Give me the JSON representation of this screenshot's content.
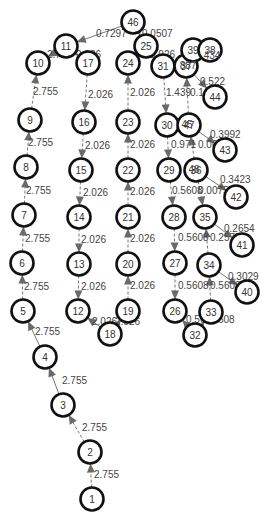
{
  "graph": {
    "type": "directed-weighted-graph",
    "nodes": [
      {
        "id": "1",
        "x": 92,
        "y": 499
      },
      {
        "id": "2",
        "x": 90,
        "y": 452
      },
      {
        "id": "3",
        "x": 63,
        "y": 405
      },
      {
        "id": "4",
        "x": 45,
        "y": 357
      },
      {
        "id": "5",
        "x": 23,
        "y": 311
      },
      {
        "id": "6",
        "x": 22,
        "y": 263
      },
      {
        "id": "7",
        "x": 24,
        "y": 215
      },
      {
        "id": "8",
        "x": 26,
        "y": 167
      },
      {
        "id": "9",
        "x": 30,
        "y": 120
      },
      {
        "id": "10",
        "x": 38,
        "y": 63
      },
      {
        "id": "11",
        "x": 66,
        "y": 46
      },
      {
        "id": "17",
        "x": 88,
        "y": 63
      },
      {
        "id": "16",
        "x": 84,
        "y": 122
      },
      {
        "id": "15",
        "x": 81,
        "y": 170
      },
      {
        "id": "14",
        "x": 79,
        "y": 217
      },
      {
        "id": "13",
        "x": 79,
        "y": 264
      },
      {
        "id": "12",
        "x": 78,
        "y": 311
      },
      {
        "id": "18",
        "x": 110,
        "y": 334
      },
      {
        "id": "19",
        "x": 128,
        "y": 311
      },
      {
        "id": "20",
        "x": 128,
        "y": 264
      },
      {
        "id": "21",
        "x": 128,
        "y": 217
      },
      {
        "id": "22",
        "x": 128,
        "y": 170
      },
      {
        "id": "23",
        "x": 128,
        "y": 122
      },
      {
        "id": "24",
        "x": 128,
        "y": 63
      },
      {
        "id": "25",
        "x": 146,
        "y": 46
      },
      {
        "id": "46",
        "x": 133,
        "y": 22
      },
      {
        "id": "31",
        "x": 163,
        "y": 66
      },
      {
        "id": "37",
        "x": 186,
        "y": 66
      },
      {
        "id": "39",
        "x": 193,
        "y": 50
      },
      {
        "id": "38",
        "x": 210,
        "y": 50
      },
      {
        "id": "44",
        "x": 215,
        "y": 97
      },
      {
        "id": "30",
        "x": 167,
        "y": 125
      },
      {
        "id": "47",
        "x": 189,
        "y": 125
      },
      {
        "id": "43",
        "x": 225,
        "y": 150
      },
      {
        "id": "29",
        "x": 169,
        "y": 170
      },
      {
        "id": "36",
        "x": 196,
        "y": 170
      },
      {
        "id": "42",
        "x": 236,
        "y": 197
      },
      {
        "id": "28",
        "x": 174,
        "y": 217
      },
      {
        "id": "35",
        "x": 205,
        "y": 217
      },
      {
        "id": "41",
        "x": 242,
        "y": 245
      },
      {
        "id": "27",
        "x": 175,
        "y": 263
      },
      {
        "id": "34",
        "x": 209,
        "y": 265
      },
      {
        "id": "40",
        "x": 247,
        "y": 292
      },
      {
        "id": "26",
        "x": 175,
        "y": 311
      },
      {
        "id": "33",
        "x": 211,
        "y": 312
      },
      {
        "id": "32",
        "x": 195,
        "y": 335
      }
    ],
    "overlay_labels": [
      {
        "text": "45",
        "x": 187,
        "y": 125
      },
      {
        "text": "48",
        "x": 194,
        "y": 170
      },
      {
        "text": "887",
        "x": 188,
        "y": 66
      },
      {
        "text": "434",
        "x": 212,
        "y": 56
      }
    ],
    "edges": [
      {
        "from": "1",
        "to": "2",
        "label": "2.755",
        "lx": 94,
        "ly": 478,
        "style": "dashed"
      },
      {
        "from": "2",
        "to": "3",
        "label": "2.755",
        "lx": 82,
        "ly": 431,
        "style": "dashed"
      },
      {
        "from": "3",
        "to": "4",
        "label": "2.755",
        "lx": 62,
        "ly": 384,
        "style": "solid"
      },
      {
        "from": "4",
        "to": "5",
        "label": "2.755",
        "lx": 35,
        "ly": 335,
        "style": "solid"
      },
      {
        "from": "5",
        "to": "6",
        "label": "2.755",
        "lx": 24,
        "ly": 290,
        "style": "dashed"
      },
      {
        "from": "6",
        "to": "7",
        "label": "2.755",
        "lx": 25,
        "ly": 242,
        "style": "dashed"
      },
      {
        "from": "7",
        "to": "8",
        "label": "2.755",
        "lx": 26,
        "ly": 194,
        "style": "dashed"
      },
      {
        "from": "8",
        "to": "9",
        "label": "2.755",
        "lx": 28,
        "ly": 146,
        "style": "dashed"
      },
      {
        "from": "9",
        "to": "10",
        "label": "2.755",
        "lx": 33,
        "ly": 95,
        "style": "dashed"
      },
      {
        "from": "11",
        "to": "10",
        "label": "2.755",
        "lx": 47,
        "ly": 58,
        "style": "solid"
      },
      {
        "from": "11",
        "to": "17",
        "label": "2.026",
        "lx": 76,
        "ly": 58,
        "style": "solid"
      },
      {
        "from": "46",
        "to": "11",
        "label": "0.7297",
        "lx": 96,
        "ly": 37,
        "style": "solid"
      },
      {
        "from": "46",
        "to": "25",
        "label": "0.0507",
        "lx": 142,
        "ly": 37,
        "style": "solid"
      },
      {
        "from": "17",
        "to": "16",
        "label": "2.026",
        "lx": 88,
        "ly": 98,
        "style": "dashed"
      },
      {
        "from": "16",
        "to": "15",
        "label": "2.026",
        "lx": 85,
        "ly": 149,
        "style": "dashed"
      },
      {
        "from": "15",
        "to": "14",
        "label": "2.026",
        "lx": 83,
        "ly": 196,
        "style": "dashed"
      },
      {
        "from": "14",
        "to": "13",
        "label": "2.026",
        "lx": 81,
        "ly": 243,
        "style": "dashed"
      },
      {
        "from": "13",
        "to": "12",
        "label": "2.026",
        "lx": 81,
        "ly": 290,
        "style": "dashed"
      },
      {
        "from": "18",
        "to": "19",
        "label": "2.026",
        "lx": 115,
        "ly": 325,
        "style": "solid"
      },
      {
        "from": "18",
        "to": "12",
        "label": "2.026",
        "lx": 92,
        "ly": 325,
        "style": "solid"
      },
      {
        "from": "19",
        "to": "20",
        "label": "2.026",
        "lx": 130,
        "ly": 289,
        "style": "dashed"
      },
      {
        "from": "20",
        "to": "21",
        "label": "2.026",
        "lx": 130,
        "ly": 242,
        "style": "dashed"
      },
      {
        "from": "21",
        "to": "22",
        "label": "2.026",
        "lx": 130,
        "ly": 195,
        "style": "dashed"
      },
      {
        "from": "22",
        "to": "23",
        "label": "2.026",
        "lx": 130,
        "ly": 148,
        "style": "dashed"
      },
      {
        "from": "23",
        "to": "24",
        "label": "2.026",
        "lx": 130,
        "ly": 96,
        "style": "dashed"
      },
      {
        "from": "25",
        "to": "31",
        "label": "2.026",
        "lx": 150,
        "ly": 58,
        "style": "solid"
      },
      {
        "from": "31",
        "to": "30",
        "label": "1.439",
        "lx": 166,
        "ly": 96,
        "style": "dashed"
      },
      {
        "from": "47",
        "to": "37",
        "label": "0.1259",
        "lx": 190,
        "ly": 96,
        "style": "dashed"
      },
      {
        "from": "37",
        "to": "44",
        "label": "0.522",
        "lx": 200,
        "ly": 85,
        "style": "solid"
      },
      {
        "from": "30",
        "to": "29",
        "label": "0.971",
        "lx": 171,
        "ly": 148,
        "style": "dashed"
      },
      {
        "from": "36",
        "to": "47",
        "label": "0.06112",
        "lx": 198,
        "ly": 148,
        "style": "dashed"
      },
      {
        "from": "47",
        "to": "43",
        "label": "0.3992",
        "lx": 210,
        "ly": 138,
        "style": "solid"
      },
      {
        "from": "29",
        "to": "28",
        "label": "0.5608",
        "lx": 172,
        "ly": 194,
        "style": "dashed"
      },
      {
        "from": "36",
        "to": "35",
        "label": "0.007521",
        "lx": 198,
        "ly": 194,
        "style": "dashed"
      },
      {
        "from": "36",
        "to": "42",
        "label": "0.3423",
        "lx": 220,
        "ly": 183,
        "style": "solid"
      },
      {
        "from": "28",
        "to": "27",
        "label": "0.5608",
        "lx": 178,
        "ly": 241,
        "style": "dashed"
      },
      {
        "from": "34",
        "to": "35",
        "label": "0.2575",
        "lx": 210,
        "ly": 241,
        "style": "dashed"
      },
      {
        "from": "35",
        "to": "41",
        "label": "0.2654",
        "lx": 224,
        "ly": 232,
        "style": "solid"
      },
      {
        "from": "27",
        "to": "26",
        "label": "0.5608",
        "lx": 178,
        "ly": 289,
        "style": "dashed"
      },
      {
        "from": "33",
        "to": "34",
        "label": "0.5608",
        "lx": 210,
        "ly": 289,
        "style": "dashed"
      },
      {
        "from": "34",
        "to": "40",
        "label": "0.3029",
        "lx": 228,
        "ly": 280,
        "style": "solid"
      },
      {
        "from": "32",
        "to": "26",
        "label": "0.5608",
        "lx": 186,
        "ly": 323,
        "style": "solid"
      },
      {
        "from": "32",
        "to": "33",
        "label": "0.5608",
        "lx": 204,
        "ly": 323,
        "style": "solid"
      }
    ]
  },
  "colors": {
    "node_stroke": "#111111",
    "node_fill": "#ffffff",
    "edge": "#777777",
    "arrow": "#6a6a6a",
    "label": "#444444",
    "background": "#ffffff"
  }
}
